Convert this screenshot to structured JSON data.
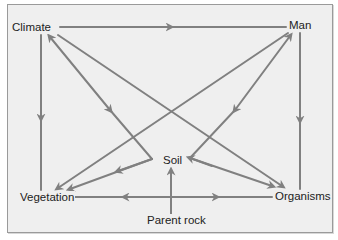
{
  "diagram": {
    "type": "soil-forming factors diagram",
    "colors": {
      "background": "#efefef",
      "border": "#9a9a9a",
      "arrow": "#808080",
      "text": "#222222"
    },
    "nodes": {
      "climate": "Climate",
      "man": "Man",
      "vegetation": "Vegetation",
      "organisms": "Organisms",
      "soil": "Soil",
      "parent_rock": "Parent rock"
    },
    "edges": [
      {
        "from": "Climate",
        "to": "Man",
        "arrow": "forward"
      },
      {
        "from": "Climate",
        "to": "Vegetation",
        "arrow": "forward"
      },
      {
        "from": "Man",
        "to": "Organisms",
        "arrow": "forward"
      },
      {
        "from": "Climate",
        "to": "Organisms",
        "arrow": "forward"
      },
      {
        "from": "Man",
        "to": "Vegetation",
        "arrow": "forward"
      },
      {
        "from": "Climate",
        "to": "Soil",
        "arrow": "both",
        "via_bend": true
      },
      {
        "from": "Soil",
        "to": "Vegetation",
        "arrow": "both"
      },
      {
        "from": "Man",
        "to": "Soil",
        "arrow": "both",
        "via_bend": true
      },
      {
        "from": "Soil",
        "to": "Organisms",
        "arrow": "both"
      },
      {
        "from": "Parent rock",
        "to": "Vegetation",
        "arrow": "forward"
      },
      {
        "from": "Parent rock",
        "to": "Organisms",
        "arrow": "forward"
      },
      {
        "from": "Parent rock",
        "to": "Soil",
        "arrow": "forward"
      }
    ]
  }
}
